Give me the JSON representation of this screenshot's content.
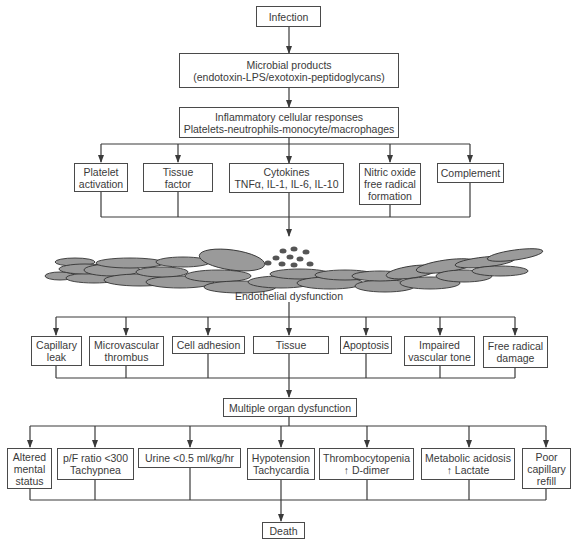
{
  "diagram": {
    "top": {
      "infection": [
        "Infection"
      ],
      "microbial": [
        "Microbial products",
        "(endotoxin-LPS/exotoxin-peptidoglycans)"
      ],
      "inflammatory": [
        "Inflammatory cellular responses",
        "Platelets-neutrophils-monocyte/macrophages"
      ]
    },
    "mediators": [
      [
        "Platelet",
        "activation"
      ],
      [
        "Tissue",
        "factor"
      ],
      [
        "Cytokines",
        "TNFα, IL-1, IL-6, IL-10"
      ],
      [
        "Nitric oxide",
        "free radical",
        "formation"
      ],
      [
        "Complement"
      ]
    ],
    "endothelium": {
      "label": "Endothelial dysfunction",
      "illustration": "endothelial-cells-with-leukocytes"
    },
    "effects": [
      [
        "Capillary",
        "leak"
      ],
      [
        "Microvascular",
        "thrombus"
      ],
      [
        "Cell adhesion"
      ],
      [
        "Tissue"
      ],
      [
        "Apoptosis"
      ],
      [
        "Impaired",
        "vascular tone"
      ],
      [
        "Free radical",
        "damage"
      ]
    ],
    "mods": [
      "Multiple organ dysfunction"
    ],
    "organs": [
      [
        "Altered",
        "mental",
        "status"
      ],
      [
        "p/F ratio <300",
        "Tachypnea"
      ],
      [
        "Urine <0.5 ml/kg/hr"
      ],
      [
        "Hypotension",
        "Tachycardia"
      ],
      [
        "Thrombocytopenia",
        "↑ D-dimer"
      ],
      [
        "Metabolic acidosis",
        "↑ Lactate"
      ],
      [
        "Poor",
        "capillary",
        "refill"
      ]
    ],
    "outcome": [
      "Death"
    ],
    "colors": {
      "line": "#3a3a3a",
      "cell_fill": "#9a9a9a",
      "cell_stroke": "#333333",
      "leukocyte": "#555555"
    }
  }
}
